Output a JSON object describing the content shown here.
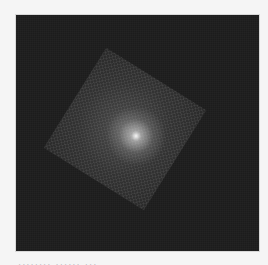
{
  "image": {
    "description": "Dark square field with a rotated lighter square and a bright central spot",
    "background_color": "#1c1c1c",
    "tile_color": "#3a3a3a",
    "center_color": "#ffffff",
    "rotation_deg": 32
  },
  "caption": {
    "text": "........ ......  ..."
  }
}
